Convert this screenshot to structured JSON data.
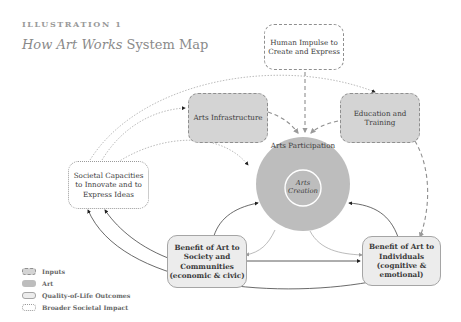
{
  "header": {
    "eyebrow": "ILLUSTRATION 1",
    "title_italic": "How Art Works",
    "title_rest": " System Map"
  },
  "nodes": {
    "impulse": {
      "label": "Human Impulse to Create and Express",
      "category": "inputs"
    },
    "infrastructure": {
      "label": "Arts Infrastructure",
      "category": "inputs"
    },
    "education": {
      "label": "Education and Training",
      "category": "inputs"
    },
    "participation": {
      "label": "Arts Participation",
      "category": "art"
    },
    "creation": {
      "label": "Arts Creation",
      "category": "art"
    },
    "societal": {
      "label": "Societal Capacities to Innovate and to Express Ideas",
      "category": "broader-societal-impact"
    },
    "benefit_society": {
      "label": "Benefit of Art to Society and Communities (economic & civic)",
      "category": "quality-of-life-outcomes"
    },
    "benefit_individuals": {
      "label": "Benefit of Art to Individuals (cognitive & emotional)",
      "category": "quality-of-life-outcomes"
    }
  },
  "legend": [
    {
      "key": "input",
      "label": "Inputs"
    },
    {
      "key": "art",
      "label": "Art"
    },
    {
      "key": "quality",
      "label": "Quality-of-Life Outcomes"
    },
    {
      "key": "broad",
      "label": "Broader Societal Impact"
    }
  ],
  "colors": {
    "input_fill": "#d4d4d4",
    "art_fill": "#bdbdbd",
    "quality_fill": "#ececec",
    "stroke": "#8f8f8f",
    "title": "#8a8a8a"
  }
}
